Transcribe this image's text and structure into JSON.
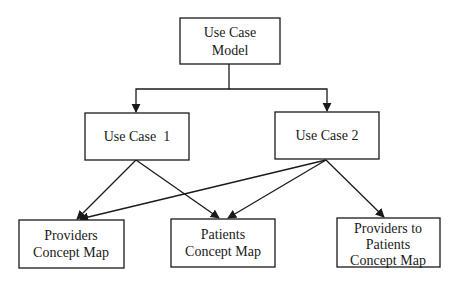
{
  "diagram": {
    "type": "hierarchy",
    "nodes": [
      {
        "id": "model",
        "lines": [
          "Use Case",
          "Model"
        ]
      },
      {
        "id": "uc1",
        "lines": [
          "Use Case  1"
        ]
      },
      {
        "id": "uc2",
        "lines": [
          "Use Case 2"
        ]
      },
      {
        "id": "providers",
        "lines": [
          "Providers",
          "Concept Map"
        ]
      },
      {
        "id": "patients",
        "lines": [
          "Patients",
          "Concept Map"
        ]
      },
      {
        "id": "p2p",
        "lines": [
          "Providers to",
          "Patients",
          "Concept Map"
        ]
      }
    ],
    "edges": [
      {
        "from": "model",
        "to": "uc1"
      },
      {
        "from": "model",
        "to": "uc2"
      },
      {
        "from": "uc1",
        "to": "providers"
      },
      {
        "from": "uc1",
        "to": "patients"
      },
      {
        "from": "uc2",
        "to": "providers"
      },
      {
        "from": "uc2",
        "to": "patients"
      },
      {
        "from": "uc2",
        "to": "p2p"
      }
    ]
  }
}
